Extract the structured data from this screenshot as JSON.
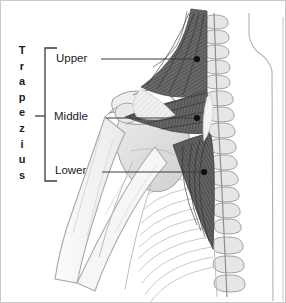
{
  "figure": {
    "title_vertical": "Trapezius",
    "title_letters": [
      "T",
      "r",
      "a",
      "p",
      "e",
      "z",
      "i",
      "u",
      "s"
    ],
    "view": "posterior",
    "background_color": "#ffffff",
    "border_color": "#c9c9c9",
    "line_color": "#3b3b3b",
    "text_color": "#1b1b1b",
    "muscle_dark_color": "#5d5d5d",
    "muscle_mid_color": "#8c8c8c",
    "bone_color": "#d8d8d8",
    "outline_color": "#9a9a9a"
  },
  "bracket": {
    "x": 44,
    "top_y": 47,
    "bottom_y": 180,
    "arm_length": 12,
    "tick_y": 115,
    "tick_length": 10
  },
  "labels": [
    {
      "id": "upper",
      "text": "Upper",
      "leader_from_x": 100,
      "leader_to_x": 196,
      "leader_y": 58,
      "dot_x": 196,
      "dot_y": 58
    },
    {
      "id": "middle",
      "text": "Middle",
      "leader_from_x": 105,
      "leader_to_x": 196,
      "leader_y": 117,
      "dot_x": 196,
      "dot_y": 117
    },
    {
      "id": "lower",
      "text": "Lower",
      "leader_from_x": 101,
      "leader_to_x": 203,
      "leader_y": 171,
      "dot_x": 203,
      "dot_y": 171
    }
  ]
}
